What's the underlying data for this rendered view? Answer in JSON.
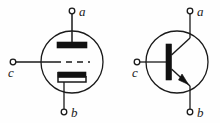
{
  "figure": {
    "background_color": "#fefefe",
    "stroke_color": "#1a1a1a",
    "fill_color": "#111111",
    "width": 220,
    "height": 123
  },
  "symbols": [
    {
      "id": "vacuum-tube-triode",
      "name": "vacuum tube triode symbol",
      "envelope": {
        "shape": "circle",
        "cx": 72,
        "cy": 62,
        "r": 31
      },
      "electrodes": [
        {
          "name": "anode-plate",
          "shape": "filled-bar"
        },
        {
          "name": "grid-dashed-line",
          "shape": "dashed-line"
        },
        {
          "name": "cathode-bracket",
          "shape": "filled-bar-with-bracket"
        }
      ],
      "terminals": [
        {
          "label": "a",
          "name": "terminal-a",
          "position": "top",
          "node_x": 72,
          "node_y": 11
        },
        {
          "label": "c",
          "name": "terminal-c",
          "position": "left",
          "node_x": 13,
          "node_y": 62
        },
        {
          "label": "b",
          "name": "terminal-b",
          "position": "bottom",
          "node_x": 64,
          "node_y": 112
        }
      ]
    },
    {
      "id": "bjt-npn-transistor",
      "name": "NPN bipolar junction transistor symbol",
      "envelope": {
        "shape": "circle",
        "cx": 177,
        "cy": 62,
        "r": 31
      },
      "electrodes": [
        {
          "name": "base-bar",
          "shape": "filled-vertical-bar"
        },
        {
          "name": "collector-lead",
          "shape": "diagonal-line"
        },
        {
          "name": "emitter-lead-arrow",
          "shape": "diagonal-line-with-arrow",
          "arrow_direction": "outward-npn"
        }
      ],
      "terminals": [
        {
          "label": "a",
          "name": "terminal-a",
          "position": "top",
          "node_x": 190,
          "node_y": 11
        },
        {
          "label": "c",
          "name": "terminal-c",
          "position": "left",
          "node_x": 137,
          "node_y": 62
        },
        {
          "label": "b",
          "name": "terminal-b",
          "position": "bottom",
          "node_x": 190,
          "node_y": 112
        }
      ]
    }
  ],
  "labels": {
    "left_a": "a",
    "left_c": "c",
    "left_b": "b",
    "right_a": "a",
    "right_c": "c",
    "right_b": "b"
  }
}
